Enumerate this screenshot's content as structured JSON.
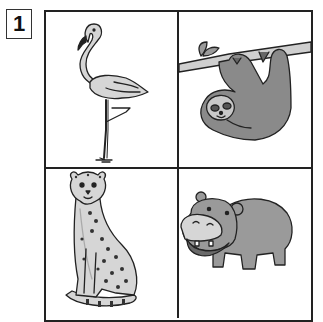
{
  "worksheet": {
    "number": "1",
    "cells": [
      {
        "animal": "flamingo",
        "position": "top-left"
      },
      {
        "animal": "sloth",
        "position": "top-right"
      },
      {
        "animal": "cheetah",
        "position": "bottom-left"
      },
      {
        "animal": "hippopotamus",
        "position": "bottom-right"
      }
    ]
  },
  "colors": {
    "line": "#222222",
    "fill_light": "#d6d6d6",
    "fill_mid": "#9a9a9a",
    "fill_dark": "#7a7a7a"
  }
}
